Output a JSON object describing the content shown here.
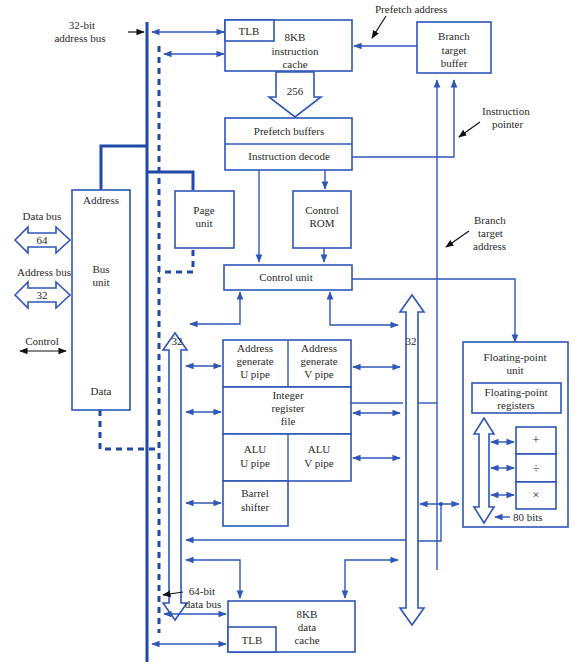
{
  "colors": {
    "line": "#2f56b8",
    "bus": "#2149a8",
    "text": "#2a2a2a"
  },
  "labels": {
    "address_bus_32": [
      "32-bit",
      "address bus"
    ],
    "data_bus_64": [
      "64-bit",
      "data bus"
    ],
    "prefetch_address": "Prefetch address",
    "instruction_pointer": [
      "Instruction",
      "pointer"
    ],
    "branch_target_address": [
      "Branch",
      "target",
      "address"
    ],
    "ext_data_bus": "Data bus",
    "ext_data_bus_width": "64",
    "ext_address_bus": "Address bus",
    "ext_address_bus_width": "32",
    "control": "Control",
    "width_256": "256",
    "width_32_left": "32",
    "width_32_right": "32",
    "bits_80": "80 bits"
  },
  "blocks": {
    "icache": {
      "tlb": "TLB",
      "lines": [
        "8KB",
        "instruction",
        "cache"
      ]
    },
    "btb": {
      "lines": [
        "Branch",
        "target",
        "buffer"
      ]
    },
    "prefetch": "Prefetch buffers",
    "decode": "Instruction decode",
    "bus_unit": {
      "top": "Address",
      "lines": [
        "Bus",
        "unit"
      ],
      "bottom": "Data"
    },
    "page_unit": {
      "lines": [
        "Page",
        "unit"
      ]
    },
    "control_rom": {
      "lines": [
        "Control",
        "ROM"
      ]
    },
    "control_unit": "Control unit",
    "agu_u": {
      "lines": [
        "Address",
        "generate",
        "U pipe"
      ]
    },
    "agu_v": {
      "lines": [
        "Address",
        "generate",
        "V pipe"
      ]
    },
    "regfile": {
      "lines": [
        "Integer",
        "register",
        "file"
      ]
    },
    "alu_u": {
      "lines": [
        "ALU",
        "U pipe"
      ]
    },
    "alu_v": {
      "lines": [
        "ALU",
        "V pipe"
      ]
    },
    "shifter": {
      "lines": [
        "Barrel",
        "shifter"
      ]
    },
    "fpu": {
      "lines": [
        "Floating-point",
        "unit"
      ]
    },
    "fp_regs": {
      "lines": [
        "Floating-point",
        "registers"
      ]
    },
    "fp_ops": [
      "+",
      "÷",
      "×"
    ],
    "dcache": {
      "tlb": "TLB",
      "lines": [
        "8KB",
        "data",
        "cache"
      ]
    }
  }
}
